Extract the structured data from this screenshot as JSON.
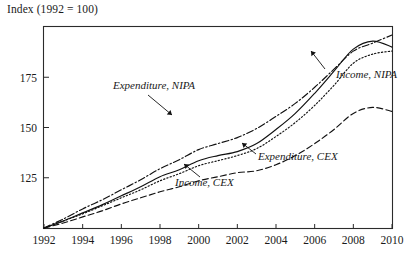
{
  "chart_data": {
    "type": "line",
    "title": "Index (1992 = 100)",
    "xlabel": "",
    "ylabel": "Index (1992 = 100)",
    "xlim": [
      1992,
      2010
    ],
    "ylim": [
      100,
      200
    ],
    "grid": false,
    "legend_position": "inline-annotations",
    "xticks": [
      "1992",
      "1994",
      "1996",
      "1998",
      "2000",
      "2002",
      "2004",
      "2006",
      "2008",
      "2010"
    ],
    "xtick_values": [
      1992,
      1994,
      1996,
      1998,
      2000,
      2002,
      2004,
      2006,
      2008,
      2010
    ],
    "yticks": [
      "125",
      "150",
      "175"
    ],
    "ytick_values": [
      125,
      150,
      175
    ],
    "x": [
      1992,
      1993,
      1994,
      1995,
      1996,
      1997,
      1998,
      1999,
      2000,
      2001,
      2002,
      2003,
      2004,
      2005,
      2006,
      2007,
      2008,
      2009,
      2010
    ],
    "series": [
      {
        "name": "Income, NIPA",
        "key": "income_nipa",
        "style": "solid",
        "label": "Income, NIPA",
        "label_x": 336,
        "label_y": 78,
        "leader": "M 325 69 L 311 51",
        "values": [
          100,
          103.5,
          107.5,
          111.5,
          116,
          120.5,
          125.5,
          129,
          133.5,
          136,
          138,
          142,
          149,
          157,
          167,
          178,
          189,
          193,
          190
        ]
      },
      {
        "name": "Expenditure, CEX",
        "key": "expenditure_cex",
        "style": "dotted",
        "label": "Expenditure, CEX",
        "label_x": 258,
        "label_y": 160,
        "leader": "M 256 154 L 242 143",
        "values": [
          100,
          103.5,
          107,
          111,
          115,
          119,
          123.5,
          127,
          131,
          133.5,
          136,
          139.5,
          145.5,
          152.5,
          161,
          171,
          182,
          186.5,
          188
        ]
      },
      {
        "name": "Expenditure, NIPA",
        "key": "expenditure_nipa",
        "style": "dashdot",
        "label": "Expenditure, NIPA",
        "label_x": 113,
        "label_y": 89,
        "leader": "M 148 95 L 172 115",
        "values": [
          100,
          104.5,
          109.5,
          114,
          119,
          124,
          129.5,
          134,
          139,
          142,
          145,
          149.5,
          155.5,
          162,
          170,
          179,
          188,
          192,
          196
        ]
      },
      {
        "name": "Income, CEX",
        "key": "income_cex",
        "style": "dashed",
        "label": "Income, CEX",
        "label_x": 175,
        "label_y": 186,
        "leader": "M 200 177 L 184 164",
        "values": [
          100,
          102.5,
          105.5,
          108.5,
          112,
          115,
          118,
          120.5,
          123.5,
          125.5,
          127.5,
          128.5,
          131.5,
          136,
          142,
          149,
          157,
          160,
          158
        ]
      }
    ]
  },
  "figure": {
    "name": "index-line-chart",
    "caption": "Index (1992 = 100)"
  }
}
